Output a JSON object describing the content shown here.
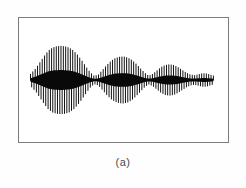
{
  "figure": {
    "caption": "(a)",
    "frame": {
      "x": 18,
      "y": 17,
      "width": 211,
      "height": 126,
      "border_color": "#7c7c80",
      "background_color": "#ffffff"
    },
    "page_background_color": "#fefefe",
    "caption_color": "#4a4a4a"
  },
  "chart_data": {
    "type": "line",
    "title": "",
    "subtitle": "",
    "xlabel": "",
    "ylabel": "",
    "grid": false,
    "legend": null,
    "axes_visible": false,
    "frame_visible": true,
    "trace_color": "#0a0a0a",
    "xlim": [
      0,
      1
    ],
    "ylim": [
      -1,
      1
    ],
    "baseline_y": 0,
    "signal_x_start": 0.055,
    "signal_x_end": 0.93,
    "oscillation_cycles": 78,
    "stroke_count": 156,
    "envelope": {
      "description": "Piecewise amplitude envelope as fraction of half-frame height, sampled at normalized x positions across the plot frame.",
      "x": [
        0.055,
        0.08,
        0.1,
        0.12,
        0.14,
        0.16,
        0.18,
        0.2,
        0.22,
        0.24,
        0.26,
        0.28,
        0.3,
        0.32,
        0.34,
        0.36,
        0.38,
        0.4,
        0.42,
        0.44,
        0.46,
        0.48,
        0.5,
        0.52,
        0.54,
        0.56,
        0.58,
        0.6,
        0.62,
        0.64,
        0.66,
        0.68,
        0.7,
        0.72,
        0.74,
        0.76,
        0.78,
        0.8,
        0.82,
        0.84,
        0.86,
        0.88,
        0.9,
        0.93
      ],
      "y": [
        0.18,
        0.34,
        0.52,
        0.7,
        0.86,
        0.95,
        0.99,
        1.0,
        0.99,
        0.95,
        0.87,
        0.74,
        0.58,
        0.4,
        0.23,
        0.12,
        0.16,
        0.3,
        0.44,
        0.56,
        0.64,
        0.68,
        0.69,
        0.66,
        0.59,
        0.48,
        0.35,
        0.22,
        0.13,
        0.18,
        0.28,
        0.38,
        0.44,
        0.46,
        0.44,
        0.38,
        0.3,
        0.22,
        0.16,
        0.14,
        0.17,
        0.2,
        0.19,
        0.13
      ]
    },
    "bursts": [
      {
        "index": 1,
        "center_x": 0.2,
        "peak_amplitude": 1.0,
        "label": "burst-1"
      },
      {
        "index": 2,
        "center_x": 0.5,
        "peak_amplitude": 0.69,
        "label": "burst-2"
      },
      {
        "index": 3,
        "center_x": 0.72,
        "peak_amplitude": 0.46,
        "label": "burst-3"
      },
      {
        "index": 4,
        "center_x": 0.87,
        "peak_amplitude": 0.2,
        "label": "burst-4"
      }
    ],
    "nodes": [
      {
        "index": 1,
        "x": 0.36,
        "amplitude": 0.12
      },
      {
        "index": 2,
        "x": 0.62,
        "amplitude": 0.13
      },
      {
        "index": 3,
        "x": 0.84,
        "amplitude": 0.14
      }
    ]
  }
}
